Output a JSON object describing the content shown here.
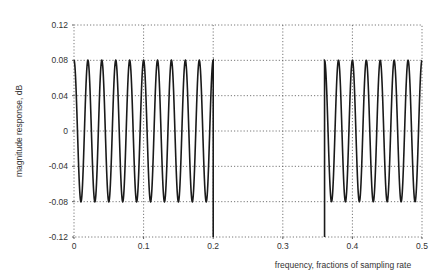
{
  "chart_data": {
    "type": "line",
    "title": "",
    "xlabel": "frequency, fractions of sampling rate",
    "ylabel": "magnitude response, dB",
    "xlim": [
      0,
      0.5
    ],
    "ylim": [
      -0.12,
      0.12
    ],
    "grid": true,
    "legend": null,
    "x_ticks": [
      0,
      0.1,
      0.2,
      0.3,
      0.4,
      0.5
    ],
    "x_tick_labels": [
      "0",
      "0.1",
      "0.2",
      "0.3",
      "0.4",
      "0.5"
    ],
    "y_ticks": [
      0.12,
      0.08,
      0.04,
      0,
      -0.04,
      -0.08,
      -0.12
    ],
    "y_tick_labels": [
      "0.12",
      "0.08",
      "0.04",
      "0",
      "-0.04",
      "-0.08",
      "-0.12"
    ],
    "series": [
      {
        "name": "passband ripple",
        "description": "equiripple oscillation between +0.08 and -0.08 dB from 0 to 0.2, drop to -0.12 at band edge",
        "x_start": 0.0,
        "x_end": 0.2,
        "ripple_max": 0.08,
        "ripple_min": -0.08,
        "ripple_period": 0.02,
        "peaks_x": [
          0,
          0.02,
          0.04,
          0.06,
          0.08,
          0.1,
          0.12,
          0.14,
          0.16,
          0.18,
          0.2
        ],
        "troughs_x": [
          0.01,
          0.03,
          0.05,
          0.07,
          0.09,
          0.11,
          0.13,
          0.15,
          0.17,
          0.19
        ],
        "edge_drop": {
          "x": 0.2,
          "y": -0.12
        }
      },
      {
        "name": "upper band ripple",
        "description": "equiripple oscillation between +0.08 and -0.08 dB from 0.36 to 0.5, rising from -0.12 at band edge",
        "x_start": 0.36,
        "x_end": 0.5,
        "ripple_max": 0.08,
        "ripple_min": -0.08,
        "ripple_period": 0.02,
        "peaks_x": [
          0.36,
          0.38,
          0.4,
          0.42,
          0.44,
          0.46,
          0.48,
          0.5
        ],
        "troughs_x": [
          0.37,
          0.39,
          0.41,
          0.43,
          0.45,
          0.47,
          0.49
        ],
        "edge_drop": {
          "x": 0.36,
          "y": -0.12
        }
      }
    ]
  },
  "layout": {
    "plot_left": 74,
    "plot_right": 422,
    "plot_top": 25,
    "plot_bottom": 237
  }
}
